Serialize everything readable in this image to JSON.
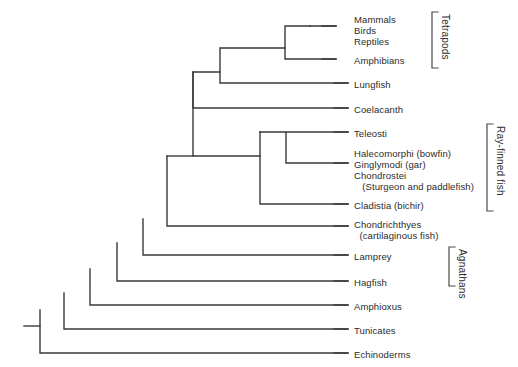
{
  "diagram": {
    "type": "cladogram",
    "line_color": "#3a3a3a",
    "text_color": "#2b2b2b",
    "background": "#ffffff"
  },
  "leaves": [
    {
      "id": "mammals",
      "label": "Mammals",
      "x": 354,
      "y": 14,
      "tip_y": null,
      "tip_x": null
    },
    {
      "id": "birds",
      "label": "Birds",
      "x": 354,
      "y": 25,
      "tip_y": 26,
      "tip_x": 336
    },
    {
      "id": "reptiles",
      "label": "Reptiles",
      "x": 354,
      "y": 36,
      "tip_y": null,
      "tip_x": null
    },
    {
      "id": "amphibians",
      "label": "Amphibians",
      "x": 354,
      "y": 55,
      "tip_y": 59,
      "tip_x": 336
    },
    {
      "id": "lungfish",
      "label": "Lungfish",
      "x": 354,
      "y": 79,
      "tip_y": 83,
      "tip_x": 348
    },
    {
      "id": "coelacanth",
      "label": "Coelacanth",
      "x": 354,
      "y": 104,
      "tip_y": 108,
      "tip_x": 348
    },
    {
      "id": "teleosti",
      "label": "Teleosti",
      "x": 354,
      "y": 128,
      "tip_y": 132,
      "tip_x": 348
    },
    {
      "id": "halecomorphi",
      "label": "Halecomorphi (bowfin)",
      "x": 354,
      "y": 148,
      "tip_y": null,
      "tip_x": null
    },
    {
      "id": "ginglymodi",
      "label": "Ginglymodi (gar)",
      "x": 354,
      "y": 159,
      "tip_y": 163,
      "tip_x": 348
    },
    {
      "id": "chondrostei",
      "label": "Chondrostei",
      "x": 354,
      "y": 170,
      "tip_y": null,
      "tip_x": null
    },
    {
      "id": "chondrostei2",
      "label": "   (Sturgeon and paddlefish)",
      "x": 354,
      "y": 181,
      "tip_y": null,
      "tip_x": null
    },
    {
      "id": "cladistia",
      "label": "Cladistia (bichir)",
      "x": 354,
      "y": 200,
      "tip_y": 204,
      "tip_x": 348
    },
    {
      "id": "chondrichthyes",
      "label": "Chondrichthyes",
      "x": 354,
      "y": 219,
      "tip_y": 226,
      "tip_x": 348
    },
    {
      "id": "chondrichthyes2",
      "label": "  (cartilaginous fish)",
      "x": 354,
      "y": 230,
      "tip_y": null,
      "tip_x": null
    },
    {
      "id": "lamprey",
      "label": "Lamprey",
      "x": 354,
      "y": 251,
      "tip_y": 255,
      "tip_x": 348
    },
    {
      "id": "hagfish",
      "label": "Hagfish",
      "x": 354,
      "y": 277,
      "tip_y": 281,
      "tip_x": 348
    },
    {
      "id": "amphioxus",
      "label": "Amphioxus",
      "x": 354,
      "y": 301,
      "tip_y": 305,
      "tip_x": 348
    },
    {
      "id": "tunicates",
      "label": "Tunicates",
      "x": 354,
      "y": 325,
      "tip_y": 329,
      "tip_x": 348
    },
    {
      "id": "echinoderms",
      "label": "Echinoderms",
      "x": 354,
      "y": 349,
      "tip_y": 353,
      "tip_x": 348
    }
  ],
  "brackets": [
    {
      "id": "tetrapods",
      "label": "Tetrapods",
      "x": 432,
      "y_top": 12,
      "y_bottom": 68,
      "label_x": 440,
      "label_y": 14
    },
    {
      "id": "ray-finned-fish",
      "label": "Ray-finned fish",
      "x": 487,
      "y_top": 124,
      "y_bottom": 211,
      "label_x": 495,
      "label_y": 126
    },
    {
      "id": "agnathans",
      "label": "Agnathans",
      "x": 449,
      "y_top": 247,
      "y_bottom": 286,
      "label_x": 457,
      "label_y": 249
    }
  ],
  "edges": {
    "description": "Nested cladogram branch segments drawn as right-angle connectors",
    "paths": [
      {
        "id": "root-stem",
        "d": "M24,326 L40,326"
      },
      {
        "id": "node-root",
        "d": "M40,326 L40,353 L348,353 M40,326 L40,310"
      },
      {
        "id": "node-tunicates",
        "d": "M64,310 L64,329 L348,329 M64,310 L64,293"
      },
      {
        "id": "node-amphioxus",
        "d": "M90,293 L90,305 L348,305 M90,293 L90,269"
      },
      {
        "id": "node-hagfish",
        "d": "M117,269 L117,281 L348,281 M117,269 L117,243"
      },
      {
        "id": "node-lamprey",
        "d": "M143,243 L143,255 L348,255 M143,243 L143,219"
      },
      {
        "id": "node-chondr",
        "d": "M167,219 L167,226 L348,226 M167,219 L167,156"
      },
      {
        "id": "node-gnatho",
        "d": "M167,156 L193,156"
      },
      {
        "id": "node-sarco",
        "d": "M193,72 L193,156 L260,156"
      },
      {
        "id": "node-sarco-top",
        "d": "M193,72 L193,108 L348,108 M193,72 L220,72"
      },
      {
        "id": "node-tetra-lf",
        "d": "M220,48 L220,83 L348,83 M220,48 L285,48"
      },
      {
        "id": "node-tetra",
        "d": "M285,26 L285,59 L336,59 M285,26 L310,26"
      },
      {
        "id": "node-amniote",
        "d": "M310,26 L336,26 M310,26 L310,26"
      },
      {
        "id": "node-actino",
        "d": "M260,156 L260,204 L348,204 M260,156 L260,132"
      },
      {
        "id": "node-teleo",
        "d": "M260,132 L286,132 M286,132 L286,163 L348,163 M286,132 L348,132"
      }
    ]
  }
}
